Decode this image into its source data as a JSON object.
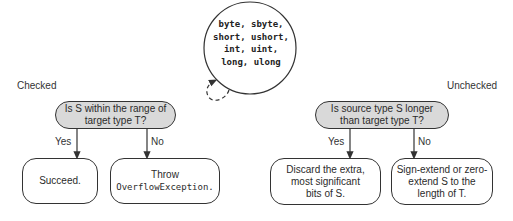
{
  "integral_types": {
    "lines": [
      "byte, sbyte,",
      "short, ushort,",
      "int, uint,",
      "long, ulong"
    ]
  },
  "checked": {
    "title": "Checked",
    "question_line1": "Is S within the range of",
    "question_line2": "target type T?",
    "yes_label": "Yes",
    "no_label": "No",
    "yes_result": "Succeed.",
    "no_result_line1": "Throw",
    "no_result_line2": "OverflowException."
  },
  "unchecked": {
    "title": "Unchecked",
    "question_line1": "Is source type S longer",
    "question_line2": "than target type T?",
    "yes_label": "Yes",
    "no_label": "No",
    "yes_result_line1": "Discard the extra,",
    "yes_result_line2": "most significant",
    "yes_result_line3": "bits of S.",
    "no_result_line1": "Sign-extend or zero-",
    "no_result_line2": "extend S to the",
    "no_result_line3": "length of T."
  },
  "colors": {
    "decision_fill": "#d9d9d9",
    "stroke": "#333333"
  }
}
